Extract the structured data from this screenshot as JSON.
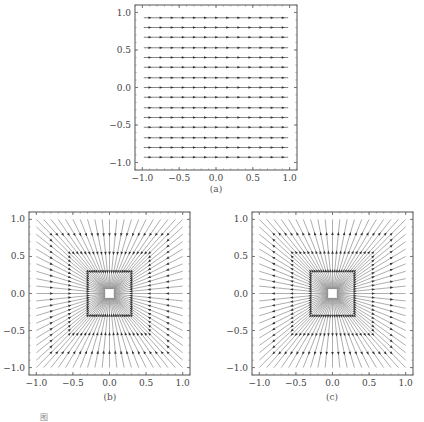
{
  "chart_data": [
    {
      "id": "a",
      "type": "line",
      "subtype": "vector-field-streamlines",
      "title": "",
      "panel_label": "(a)",
      "description": "Uniform horizontal field: 15 parallel horizontal field lines with arrow markers",
      "xlabel": "",
      "ylabel": "",
      "xlim": [
        -1.1,
        1.1
      ],
      "ylim": [
        -1.1,
        1.1
      ],
      "xticks": [
        -1.0,
        -0.5,
        0.0,
        0.5,
        1.0
      ],
      "yticks": [
        -1.0,
        -0.5,
        0.0,
        0.5,
        1.0
      ],
      "xtick_labels": [
        "−1.0",
        "−0.5",
        "0.0",
        "0.5",
        "1.0"
      ],
      "ytick_labels": [
        "−1.0",
        "−0.5",
        "0.0",
        "0.5",
        "1.0"
      ],
      "grid": false,
      "lines_y": [
        -0.93,
        -0.8,
        -0.67,
        -0.53,
        -0.4,
        -0.27,
        -0.13,
        0.0,
        0.13,
        0.27,
        0.4,
        0.53,
        0.67,
        0.8,
        0.93
      ],
      "line_x_range": [
        -0.98,
        0.98
      ],
      "markers_per_line": 13
    },
    {
      "id": "b",
      "type": "line",
      "subtype": "vector-field-streamlines",
      "title": "",
      "panel_label": "(b)",
      "description": "Radial field: straight field lines through origin to square boundary points (step 0.1)",
      "xlabel": "",
      "ylabel": "",
      "xlim": [
        -1.1,
        1.1
      ],
      "ylim": [
        -1.1,
        1.1
      ],
      "xticks": [
        -1.0,
        -0.5,
        0.0,
        0.5,
        1.0
      ],
      "yticks": [
        -1.0,
        -0.5,
        0.0,
        0.5,
        1.0
      ],
      "xtick_labels": [
        "−1.0",
        "−0.5",
        "0.0",
        "0.5",
        "1.0"
      ],
      "ytick_labels": [
        "−1.0",
        "−0.5",
        "0.0",
        "0.5",
        "1.0"
      ],
      "grid": false,
      "boundary_step": 0.1,
      "center": [
        0,
        0
      ]
    },
    {
      "id": "c",
      "type": "line",
      "subtype": "vector-field-streamlines",
      "title": "",
      "panel_label": "(c)",
      "description": "Radial field (alternate): straight field lines through origin to square boundary points (step 0.1)",
      "xlabel": "",
      "ylabel": "",
      "xlim": [
        -1.1,
        1.1
      ],
      "ylim": [
        -1.1,
        1.1
      ],
      "xticks": [
        -1.0,
        -0.5,
        0.0,
        0.5,
        1.0
      ],
      "yticks": [
        -1.0,
        -0.5,
        0.0,
        0.5,
        1.0
      ],
      "xtick_labels": [
        "−1.0",
        "−0.5",
        "0.0",
        "0.5",
        "1.0"
      ],
      "ytick_labels": [
        "−1.0",
        "−0.5",
        "0.0",
        "0.5",
        "1.0"
      ],
      "grid": false,
      "boundary_step": 0.1,
      "center": [
        0,
        0
      ]
    }
  ],
  "layout": {
    "panels": {
      "a": {
        "frame": [
          135,
          5,
          297,
          170
        ]
      },
      "b": {
        "frame": [
          29,
          212,
          190,
          375
        ]
      },
      "c": {
        "frame": [
          252,
          212,
          413,
          375
        ]
      }
    }
  },
  "caption": "图"
}
